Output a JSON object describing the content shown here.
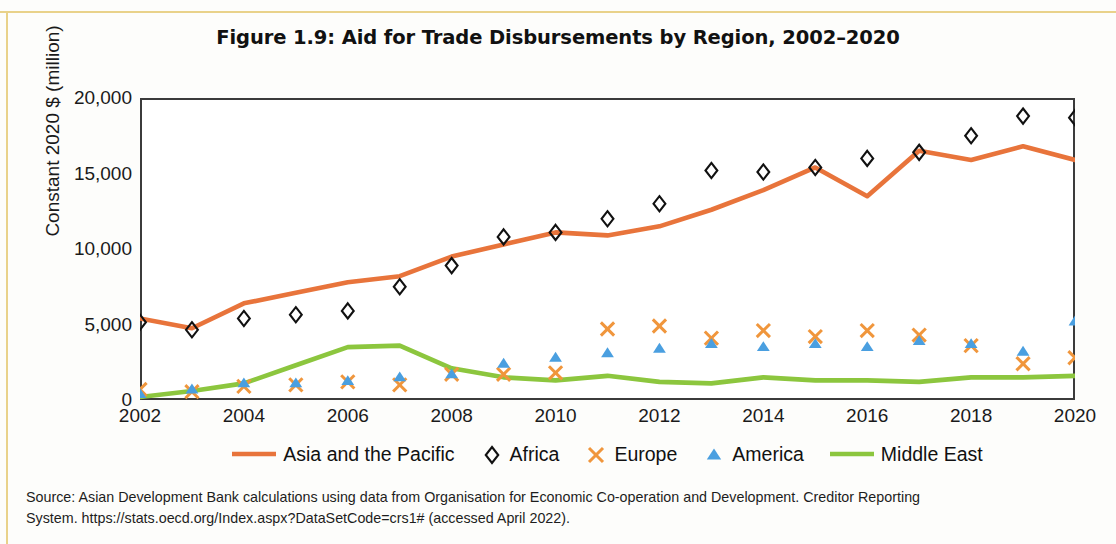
{
  "figure": {
    "title": "Figure 1.9: Aid for Trade Disbursements by Region, 2002–2020",
    "source_line_1": "Source: Asian Development Bank calculations using data from Organisation for Economic Co-operation and Development. Creditor Reporting",
    "source_line_2": "System. https://stats.oecd.org/Index.aspx?DataSetCode=crs1# (accessed April 2022)."
  },
  "colors": {
    "asia_pacific": "#e8743b",
    "africa": "#111111",
    "europe": "#f0963c",
    "america": "#4a9fe0",
    "middle_east": "#8cc63e",
    "axis": "#3b3b3b",
    "page_rule": "#e9d28a"
  },
  "chart_data": {
    "type": "line",
    "title": "Figure 1.9: Aid for Trade Disbursements by Region, 2002–2020",
    "xlabel": "",
    "ylabel": "Constant 2020 $ (million)",
    "ylim": [
      0,
      20000
    ],
    "xlim": [
      2002,
      2020
    ],
    "grid": false,
    "legend_position": "bottom",
    "y_ticks": [
      0,
      5000,
      10000,
      15000,
      20000
    ],
    "y_tick_labels": [
      "0",
      "5,000",
      "10,000",
      "15,000",
      "20,000"
    ],
    "x_ticks": [
      2002,
      2004,
      2006,
      2008,
      2010,
      2012,
      2014,
      2016,
      2018,
      2020
    ],
    "x_tick_labels": [
      "2002",
      "2004",
      "2006",
      "2008",
      "2010",
      "2012",
      "2014",
      "2016",
      "2018",
      "2020"
    ],
    "x": [
      2002,
      2003,
      2004,
      2005,
      2006,
      2007,
      2008,
      2009,
      2010,
      2011,
      2012,
      2013,
      2014,
      2015,
      2016,
      2017,
      2018,
      2019,
      2020
    ],
    "series": [
      {
        "name": "Asia and the Pacific",
        "marker": "none",
        "style": "line",
        "color": "#e8743b",
        "values": [
          5400,
          4750,
          6400,
          7100,
          7800,
          8200,
          9500,
          10300,
          11100,
          10900,
          11500,
          12600,
          13900,
          15400,
          13500,
          16500,
          15900,
          16800,
          15900
        ]
      },
      {
        "name": "Africa",
        "marker": "diamond",
        "style": "markers",
        "color": "#111111",
        "values": [
          5150,
          4650,
          5400,
          5650,
          5900,
          7500,
          8900,
          10800,
          11100,
          12000,
          13000,
          15200,
          15100,
          15400,
          16000,
          16400,
          17500,
          18800,
          18700
        ]
      },
      {
        "name": "Europe",
        "marker": "x",
        "style": "markers",
        "color": "#f0963c",
        "values": [
          700,
          550,
          900,
          1000,
          1200,
          1000,
          1700,
          1700,
          1800,
          4700,
          4900,
          4100,
          4600,
          4200,
          4600,
          4300,
          3600,
          2400,
          2800
        ]
      },
      {
        "name": "America",
        "marker": "triangle",
        "style": "markers",
        "color": "#4a9fe0",
        "values": [
          400,
          700,
          1100,
          1100,
          1250,
          1500,
          1700,
          2400,
          2800,
          3100,
          3400,
          3700,
          3500,
          3700,
          3500,
          3900,
          3700,
          3200,
          5200
        ]
      },
      {
        "name": "Middle East",
        "marker": "none",
        "style": "line",
        "color": "#8cc63e",
        "values": [
          200,
          600,
          1100,
          2300,
          3500,
          3600,
          2100,
          1500,
          1300,
          1600,
          1200,
          1100,
          1500,
          1300,
          1300,
          1200,
          1500,
          1500,
          1600
        ]
      }
    ]
  },
  "legend": [
    {
      "label": "Asia and the Pacific",
      "type": "line",
      "color": "#e8743b"
    },
    {
      "label": "Africa",
      "type": "diamond",
      "color": "#111111"
    },
    {
      "label": "Europe",
      "type": "x",
      "color": "#f0963c"
    },
    {
      "label": "America",
      "type": "triangle",
      "color": "#4a9fe0"
    },
    {
      "label": "Middle East",
      "type": "line",
      "color": "#8cc63e"
    }
  ]
}
